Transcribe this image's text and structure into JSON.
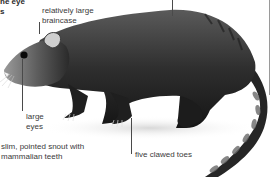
{
  "figure": {
    "labels": {
      "cut_off_top_line1": "ne eye",
      "cut_off_top_line2": "s",
      "braincase": [
        "relatively large",
        "braincase"
      ],
      "eyes": [
        "large",
        "eyes"
      ],
      "snout": [
        "slim, pointed snout with",
        "mammalian teeth"
      ],
      "toes": "five clawed toes"
    },
    "colors": {
      "background": "#ffffff",
      "fur_dark": "#1e1e1e",
      "fur_mid": "#4a4a4a",
      "fur_light": "#8a8a8a",
      "label_text": "#3a3a3a",
      "leader_line": "#4a4a4a"
    }
  }
}
